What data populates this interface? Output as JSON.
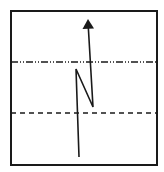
{
  "diagram": {
    "type": "wave-ray-path-schematic",
    "background": "#ffffff",
    "stroke_color": "#1a1a1a",
    "frame": {
      "x": 11,
      "y": 11,
      "width": 146,
      "height": 154,
      "stroke_width": 2
    },
    "boundaries": [
      {
        "name": "upper-boundary",
        "style": "dash-dot-dot",
        "y": 62,
        "x1": 11,
        "x2": 157,
        "dasharray": "7 2 1 2 1 2"
      },
      {
        "name": "lower-boundary",
        "style": "dashed",
        "y": 113,
        "x1": 11,
        "x2": 157,
        "dasharray": "5 4"
      }
    ],
    "path": {
      "name": "zigzag-ray",
      "points": [
        [
          79,
          157
        ],
        [
          76,
          69
        ],
        [
          93,
          107
        ],
        [
          88,
          22
        ]
      ],
      "stroke_width": 1.6,
      "arrow": {
        "tip": [
          88,
          19
        ],
        "base_left": [
          82.5,
          29
        ],
        "base_right": [
          94,
          28.5
        ]
      }
    }
  }
}
